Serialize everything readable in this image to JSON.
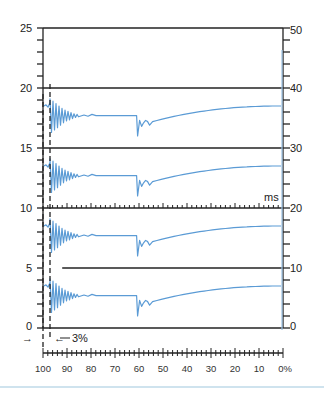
{
  "chart_data": {
    "type": "line",
    "title": "",
    "left_axis": {
      "label": "",
      "ticks": [
        0,
        5,
        10,
        15,
        20,
        25
      ],
      "range": [
        0,
        25
      ],
      "minor_step": 1
    },
    "right_axis": {
      "label": "",
      "ticks": [
        0,
        10,
        20,
        30,
        40,
        50
      ],
      "range": [
        0,
        50
      ],
      "minor_step": 2
    },
    "bottom_axis": {
      "label": "%",
      "ticks": [
        "100",
        "90",
        "80",
        "70",
        "60",
        "50",
        "40",
        "30",
        "20",
        "10",
        "0%"
      ],
      "range": [
        100,
        0
      ],
      "minor_step": 2
    },
    "ms_axis_label": "ms",
    "annotation": "3%",
    "dashed_markers_percent": [
      100,
      97
    ],
    "horizontal_reference_lines": [
      {
        "y_left": 25,
        "from_percent": 100,
        "to_percent": 0
      },
      {
        "y_left": 20,
        "from_percent": 100,
        "to_percent": 0
      },
      {
        "y_left": 15,
        "from_percent": 100,
        "to_percent": 0
      },
      {
        "y_left": 10,
        "from_percent": 100,
        "to_percent": 0,
        "ms_ticks": true
      },
      {
        "y_left": 5,
        "from_percent": 92,
        "to_percent": 0
      },
      {
        "y_left": 0,
        "from_percent": 100,
        "to_percent": 0
      }
    ],
    "series": [
      {
        "name": "trace-1",
        "baseline_left": 18,
        "start": 18.5,
        "plateau": 17.7,
        "dip_at_percent": 61,
        "dip_min": 16,
        "end": 18.5
      },
      {
        "name": "trace-2",
        "baseline_left": 13,
        "start": 13.5,
        "plateau": 12.7,
        "dip_at_percent": 61,
        "dip_min": 11,
        "end": 13.5
      },
      {
        "name": "trace-3",
        "baseline_left": 8,
        "start": 8.5,
        "plateau": 7.7,
        "dip_at_percent": 61,
        "dip_min": 6,
        "end": 8.5
      },
      {
        "name": "trace-4",
        "baseline_left": 3,
        "start": 3.5,
        "plateau": 2.7,
        "dip_at_percent": 61,
        "dip_min": 1,
        "end": 3.5
      }
    ],
    "vertical_marker_percent": 1,
    "vertical_marker_right_value_top": 47,
    "grid": false,
    "legend": "none",
    "colors": {
      "trace": "#5b9bd5",
      "axis": "#222222",
      "marker": "#9cc3e6"
    }
  },
  "labels": {
    "left": [
      "25",
      "20",
      "15",
      "10",
      "5",
      "0"
    ],
    "right": [
      "50",
      "40",
      "30",
      "20",
      "10",
      "0"
    ],
    "bottom": [
      "100",
      "90",
      "80",
      "70",
      "60",
      "50",
      "40",
      "30",
      "20",
      "10",
      "0%"
    ],
    "ms": "ms",
    "annotation": "3%",
    "arrow_left": "→",
    "arrow_right": "←"
  }
}
